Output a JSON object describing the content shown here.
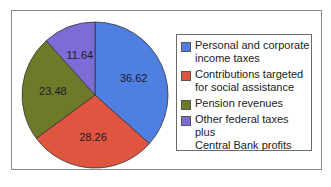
{
  "chart_data": {
    "type": "pie",
    "title": "",
    "start_angle": "12 o'clock",
    "direction": "clockwise",
    "categories": [
      "Personal and corporate income taxes",
      "Contributions targeted for social assistance",
      "Pension revenues",
      "Other federal taxes plus Central Bank profits"
    ],
    "values": [
      36.62,
      28.26,
      23.48,
      11.64
    ],
    "colors": [
      "#4f7fe0",
      "#e0553f",
      "#6e7a28",
      "#7b6cd6"
    ],
    "data_labels": [
      "36.62",
      "28.26",
      "23.48",
      "11.64"
    ],
    "legend_position": "right"
  },
  "legend": {
    "items": [
      {
        "line1": "Personal and corporate",
        "line2": "income taxes",
        "color": "#4f7fe0"
      },
      {
        "line1": "Contributions targeted",
        "line2": "for social assistance",
        "color": "#e0553f"
      },
      {
        "line1": "Pension revenues",
        "line2": "",
        "color": "#6e7a28"
      },
      {
        "line1": "Other federal taxes plus",
        "line2": "Central Bank profits",
        "color": "#7b6cd6"
      }
    ]
  }
}
